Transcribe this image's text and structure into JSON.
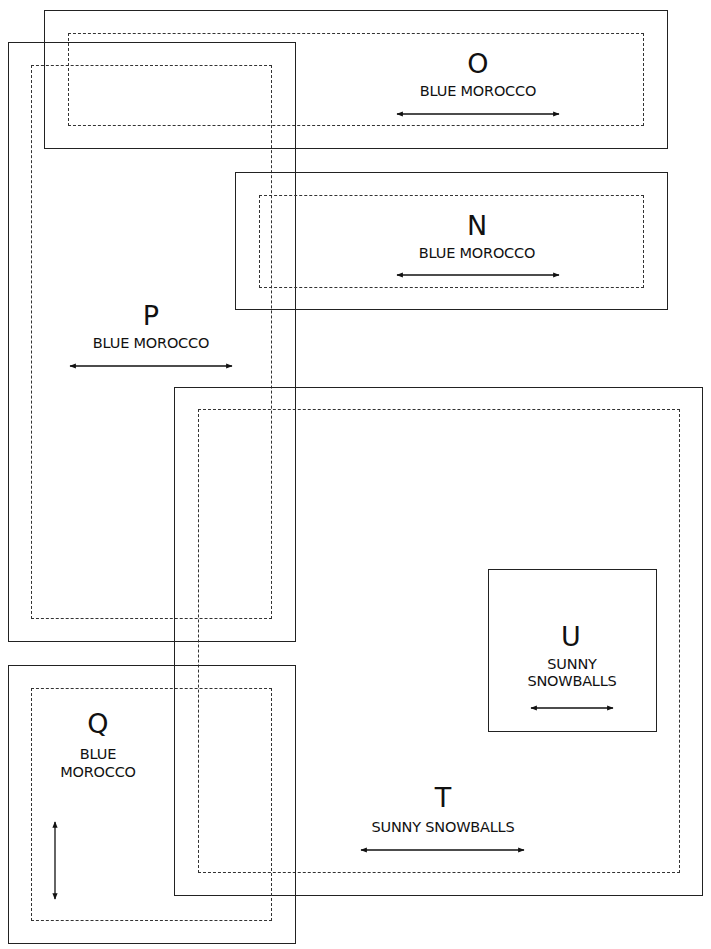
{
  "diagram": {
    "title": "",
    "zones": [
      {
        "id": "O",
        "letter": "O",
        "name": "BLUE MOROCCO",
        "name_lines": [
          "BLUE MOROCCO"
        ],
        "arrow": "horizontal"
      },
      {
        "id": "N",
        "letter": "N",
        "name": "BLUE MOROCCO",
        "name_lines": [
          "BLUE MOROCCO"
        ],
        "arrow": "horizontal"
      },
      {
        "id": "P",
        "letter": "P",
        "name": "BLUE MOROCCO",
        "name_lines": [
          "BLUE MOROCCO"
        ],
        "arrow": "horizontal"
      },
      {
        "id": "Q",
        "letter": "Q",
        "name": "BLUE MOROCCO",
        "name_lines": [
          "BLUE",
          "MOROCCO"
        ],
        "arrow": "vertical"
      },
      {
        "id": "U",
        "letter": "U",
        "name": "SUNNY SNOWBALLS",
        "name_lines": [
          "SUNNY",
          "SNOWBALLS"
        ],
        "arrow": "horizontal"
      },
      {
        "id": "T",
        "letter": "T",
        "name": "SUNNY SNOWBALLS",
        "name_lines": [
          "SUNNY SNOWBALLS"
        ],
        "arrow": "horizontal"
      }
    ],
    "legend": {
      "solid_line": "outer boundary",
      "dashed_line": "inner boundary",
      "arrow": "orientation"
    },
    "colors": {
      "line": "#222222",
      "background": "#ffffff",
      "text": "#111111"
    }
  }
}
